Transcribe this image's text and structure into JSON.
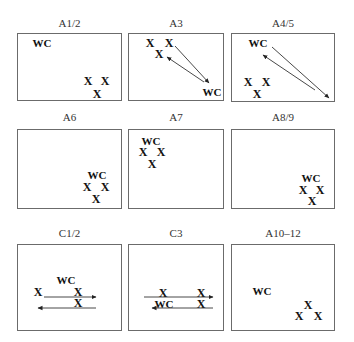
{
  "diagram": {
    "title": "",
    "panels": [
      {
        "id": "A1/2",
        "label": "A1/2",
        "box": [
          17,
          33,
          105,
          68
        ],
        "tokens": [
          {
            "t": "WC",
            "x": 42,
            "y": 43
          },
          {
            "t": "X",
            "x": 88,
            "y": 81
          },
          {
            "t": "X",
            "x": 105,
            "y": 81
          },
          {
            "t": "X",
            "x": 97,
            "y": 94
          }
        ],
        "arrows": []
      },
      {
        "id": "A3",
        "label": "A3",
        "box": [
          128,
          33,
          96,
          68
        ],
        "tokens": [
          {
            "t": "X",
            "x": 150,
            "y": 43
          },
          {
            "t": "X",
            "x": 169,
            "y": 43
          },
          {
            "t": "X",
            "x": 159,
            "y": 54
          },
          {
            "t": "WC",
            "x": 212,
            "y": 92
          }
        ],
        "arrows": [
          {
            "x1": 175,
            "y1": 46,
            "x2": 209,
            "y2": 83
          },
          {
            "x1": 204,
            "y1": 82,
            "x2": 167,
            "y2": 57
          }
        ]
      },
      {
        "id": "A4/5",
        "label": "A4/5",
        "box": [
          231,
          33,
          104,
          69
        ],
        "tokens": [
          {
            "t": "WC",
            "x": 258,
            "y": 43
          },
          {
            "t": "X",
            "x": 248,
            "y": 82
          },
          {
            "t": "X",
            "x": 266,
            "y": 82
          },
          {
            "t": "X",
            "x": 257,
            "y": 94
          }
        ],
        "arrows": [
          {
            "x1": 272,
            "y1": 47,
            "x2": 329,
            "y2": 98
          },
          {
            "x1": 315,
            "y1": 90,
            "x2": 263,
            "y2": 55
          }
        ]
      },
      {
        "id": "A6",
        "label": "A6",
        "box": [
          17,
          129,
          105,
          80
        ],
        "tokens": [
          {
            "t": "WC",
            "x": 97,
            "y": 175
          },
          {
            "t": "X",
            "x": 87,
            "y": 187
          },
          {
            "t": "X",
            "x": 105,
            "y": 187
          },
          {
            "t": "X",
            "x": 96,
            "y": 199
          }
        ],
        "arrows": []
      },
      {
        "id": "A7",
        "label": "A7",
        "box": [
          128,
          129,
          96,
          80
        ],
        "tokens": [
          {
            "t": "WC",
            "x": 151,
            "y": 141
          },
          {
            "t": "X",
            "x": 143,
            "y": 152
          },
          {
            "t": "X",
            "x": 161,
            "y": 152
          },
          {
            "t": "X",
            "x": 152,
            "y": 164
          }
        ],
        "arrows": []
      },
      {
        "id": "A8/9",
        "label": "A8/9",
        "box": [
          231,
          129,
          104,
          80
        ],
        "tokens": [
          {
            "t": "WC",
            "x": 311,
            "y": 178
          },
          {
            "t": "X",
            "x": 303,
            "y": 190
          },
          {
            "t": "X",
            "x": 320,
            "y": 190
          },
          {
            "t": "X",
            "x": 312,
            "y": 201
          }
        ],
        "arrows": []
      },
      {
        "id": "C1/2",
        "label": "C1/2",
        "box": [
          17,
          244,
          105,
          87
        ],
        "tokens": [
          {
            "t": "WC",
            "x": 66,
            "y": 280
          },
          {
            "t": "X",
            "x": 38,
            "y": 292
          },
          {
            "t": "X",
            "x": 78,
            "y": 292
          },
          {
            "t": "X",
            "x": 78,
            "y": 303
          }
        ],
        "arrows": [
          {
            "x1": 44,
            "y1": 297,
            "x2": 96,
            "y2": 297
          },
          {
            "x1": 96,
            "y1": 308,
            "x2": 38,
            "y2": 308
          }
        ]
      },
      {
        "id": "C3",
        "label": "C3",
        "box": [
          128,
          244,
          96,
          87
        ],
        "tokens": [
          {
            "t": "X",
            "x": 163,
            "y": 293
          },
          {
            "t": "X",
            "x": 201,
            "y": 293
          },
          {
            "t": "WC",
            "x": 164,
            "y": 304
          },
          {
            "t": "X",
            "x": 201,
            "y": 304
          }
        ],
        "arrows": [
          {
            "x1": 144,
            "y1": 297,
            "x2": 213,
            "y2": 297
          },
          {
            "x1": 213,
            "y1": 308,
            "x2": 152,
            "y2": 308
          }
        ]
      },
      {
        "id": "A10-12",
        "label": "A10–12",
        "box": [
          231,
          244,
          104,
          87
        ],
        "tokens": [
          {
            "t": "WC",
            "x": 262,
            "y": 291
          },
          {
            "t": "X",
            "x": 308,
            "y": 305
          },
          {
            "t": "X",
            "x": 299,
            "y": 316
          },
          {
            "t": "X",
            "x": 318,
            "y": 316
          }
        ],
        "arrows": []
      }
    ],
    "label_rows_y": [
      24,
      118,
      234
    ]
  }
}
